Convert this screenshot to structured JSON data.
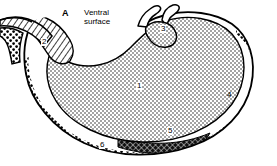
{
  "figure": {
    "panel_letter": "A",
    "caption": "Ventral\nsurface",
    "style": {
      "ink": "#000000",
      "paper": "#ffffff"
    }
  },
  "regions": [
    {
      "id": "1",
      "label": "1",
      "pattern": "fine-stipple",
      "name": "body-region"
    },
    {
      "id": "2",
      "label": "2",
      "pattern": "diagonal-hatch",
      "name": "hatched-band-region"
    },
    {
      "id": "3",
      "label": "3",
      "pattern": "fine-stipple",
      "name": "cardia-notch-region"
    },
    {
      "id": "4",
      "label": "4",
      "pattern": "coarse-dot",
      "name": "right-margin-region"
    },
    {
      "id": "5",
      "label": "5",
      "pattern": "dark-crosshatch",
      "name": "dark-band-region"
    },
    {
      "id": "6",
      "label": "6",
      "pattern": "coarse-dot",
      "name": "lower-margin-region"
    }
  ]
}
